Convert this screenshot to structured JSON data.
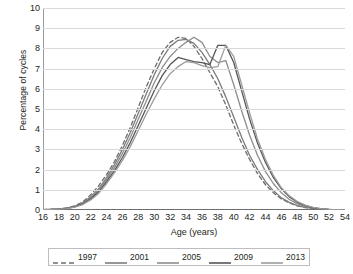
{
  "chart_data": {
    "type": "line",
    "title": "",
    "xlabel": "Age (years)",
    "ylabel": "Percentage of cycles",
    "xlim": [
      16,
      54
    ],
    "ylim": [
      0,
      10
    ],
    "grid": true,
    "legend_position": "bottom",
    "x": [
      16,
      17,
      18,
      19,
      20,
      21,
      22,
      23,
      24,
      25,
      26,
      27,
      28,
      29,
      30,
      31,
      32,
      33,
      34,
      35,
      36,
      37,
      38,
      39,
      40,
      41,
      42,
      43,
      44,
      45,
      46,
      47,
      48,
      49,
      50,
      51,
      52,
      53,
      54
    ],
    "xticks": [
      "16",
      "18",
      "20",
      "22",
      "24",
      "26",
      "28",
      "30",
      "32",
      "34",
      "36",
      "38",
      "40",
      "42",
      "44",
      "46",
      "48",
      "50",
      "52",
      "54"
    ],
    "yticks": [
      "0",
      "1",
      "2",
      "3",
      "4",
      "5",
      "6",
      "7",
      "8",
      "9",
      "10"
    ],
    "series": [
      {
        "name": "1997",
        "style": "dashed",
        "color": "#6d6d6d",
        "values": [
          0.02,
          0.03,
          0.05,
          0.1,
          0.2,
          0.4,
          0.75,
          1.2,
          1.75,
          2.4,
          3.2,
          4.1,
          5.1,
          6.1,
          7.0,
          7.8,
          8.3,
          8.55,
          8.5,
          8.1,
          7.5,
          6.8,
          6.1,
          5.2,
          4.2,
          3.3,
          2.5,
          1.8,
          1.25,
          0.85,
          0.55,
          0.35,
          0.2,
          0.12,
          0.07,
          0.04,
          0.02,
          0.01,
          0.01
        ]
      },
      {
        "name": "2001",
        "style": "solid",
        "color": "#7b7b7b",
        "values": [
          0.02,
          0.03,
          0.05,
          0.09,
          0.18,
          0.35,
          0.65,
          1.05,
          1.6,
          2.25,
          3.0,
          3.85,
          4.8,
          5.75,
          6.7,
          7.5,
          8.1,
          8.4,
          8.45,
          8.25,
          7.8,
          7.2,
          6.5,
          5.6,
          4.6,
          3.6,
          2.7,
          2.0,
          1.4,
          0.95,
          0.6,
          0.38,
          0.22,
          0.13,
          0.08,
          0.04,
          0.02,
          0.01,
          0.01
        ]
      },
      {
        "name": "2005",
        "style": "solid",
        "color": "#8d8d8d",
        "values": [
          0.02,
          0.03,
          0.05,
          0.09,
          0.17,
          0.33,
          0.6,
          0.98,
          1.5,
          2.1,
          2.8,
          3.6,
          4.5,
          5.4,
          6.3,
          7.05,
          7.6,
          8.0,
          8.3,
          8.55,
          8.3,
          7.6,
          7.3,
          7.4,
          6.2,
          4.9,
          3.7,
          2.7,
          1.9,
          1.3,
          0.85,
          0.52,
          0.3,
          0.17,
          0.1,
          0.05,
          0.03,
          0.01,
          0.01
        ]
      },
      {
        "name": "2009",
        "style": "solid",
        "color": "#555555",
        "values": [
          0.02,
          0.03,
          0.04,
          0.08,
          0.16,
          0.3,
          0.55,
          0.9,
          1.4,
          1.95,
          2.6,
          3.35,
          4.2,
          5.05,
          5.9,
          6.65,
          7.2,
          7.55,
          7.45,
          7.35,
          7.3,
          7.2,
          8.15,
          8.15,
          7.3,
          5.9,
          4.5,
          3.3,
          2.35,
          1.6,
          1.05,
          0.65,
          0.38,
          0.22,
          0.12,
          0.06,
          0.03,
          0.02,
          0.01
        ]
      },
      {
        "name": "2013",
        "style": "solid",
        "color": "#9c9c9c",
        "values": [
          0.02,
          0.03,
          0.04,
          0.07,
          0.14,
          0.27,
          0.5,
          0.82,
          1.3,
          1.85,
          2.45,
          3.15,
          3.95,
          4.75,
          5.5,
          6.2,
          6.75,
          7.1,
          7.35,
          7.3,
          7.15,
          7.05,
          7.1,
          8.15,
          7.6,
          6.2,
          4.8,
          3.5,
          2.5,
          1.7,
          1.1,
          0.7,
          0.42,
          0.24,
          0.13,
          0.07,
          0.03,
          0.02,
          0.01
        ]
      }
    ]
  }
}
